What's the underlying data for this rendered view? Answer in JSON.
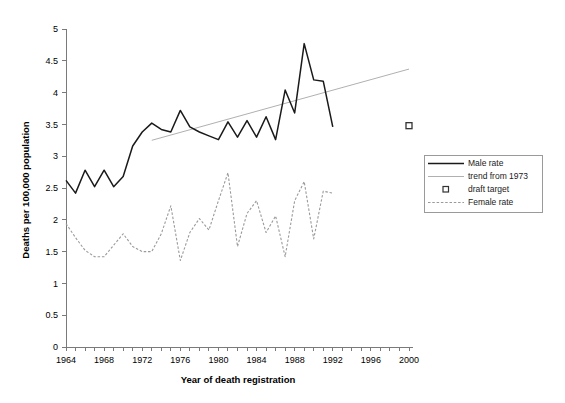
{
  "chart_data": {
    "type": "line",
    "title": "",
    "xlabel": "Year of death registration",
    "ylabel": "Deaths per 100,000 population",
    "xlim": [
      1964,
      2000
    ],
    "ylim": [
      0,
      5
    ],
    "ytick_step": 0.5,
    "xtick_step": 1,
    "xtick_label_step": 4,
    "grid": false,
    "legend_position": "right",
    "yticks": [
      "0",
      "0.5",
      "1",
      "1.5",
      "2",
      "2.5",
      "3",
      "3.5",
      "4",
      "4.5",
      "5"
    ],
    "xticks": [
      "1964",
      "1968",
      "1972",
      "1976",
      "1980",
      "1984",
      "1988",
      "1992",
      "1996",
      "2000"
    ],
    "x": [
      1964,
      1965,
      1966,
      1967,
      1968,
      1969,
      1970,
      1971,
      1972,
      1973,
      1974,
      1975,
      1976,
      1977,
      1978,
      1979,
      1980,
      1981,
      1982,
      1983,
      1984,
      1985,
      1986,
      1987,
      1988,
      1989,
      1990,
      1991,
      1992
    ],
    "series": [
      {
        "name": "Male rate",
        "style": "solid-black",
        "values": [
          2.62,
          2.42,
          2.78,
          2.52,
          2.78,
          2.52,
          2.68,
          3.16,
          3.38,
          3.52,
          3.42,
          3.38,
          3.72,
          3.46,
          3.38,
          3.32,
          3.26,
          3.54,
          3.3,
          3.56,
          3.3,
          3.62,
          3.26,
          4.04,
          3.68,
          4.77,
          4.2,
          4.18,
          3.46
        ]
      },
      {
        "name": "Female rate",
        "style": "dotted-grey",
        "values": [
          1.94,
          1.72,
          1.52,
          1.42,
          1.42,
          1.6,
          1.78,
          1.58,
          1.5,
          1.5,
          1.78,
          2.22,
          1.36,
          1.8,
          2.02,
          1.84,
          2.3,
          2.74,
          1.58,
          2.1,
          2.3,
          1.8,
          2.06,
          1.42,
          2.3,
          2.6,
          1.7,
          2.45,
          2.42
        ]
      }
    ],
    "trend": {
      "name": "trend from 1973",
      "style": "thin-grey-line",
      "x_start": 1973,
      "y_start": 3.25,
      "x_end": 2000,
      "y_end": 4.37
    },
    "target_point": {
      "name": "draft target",
      "style": "open-square-marker",
      "x": 2000,
      "y": 3.48
    },
    "legend_entries": [
      {
        "label": "Male rate",
        "marker": "solid-black-line"
      },
      {
        "label": "trend from 1973",
        "marker": "thin-grey-line"
      },
      {
        "label": "draft target",
        "marker": "open-square"
      },
      {
        "label": "Female rate",
        "marker": "dotted-grey-line"
      }
    ]
  },
  "colors": {
    "male_line": "#1a1a1a",
    "female_line": "#9a9a9a",
    "trend_line": "#b0b0b0",
    "axis": "#7a7a7a",
    "background": "#ffffff"
  }
}
